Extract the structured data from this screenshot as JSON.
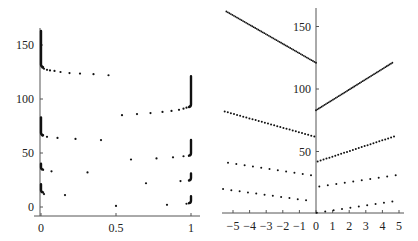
{
  "chart_data": [
    {
      "type": "scatter",
      "title": "",
      "xlabel": "",
      "ylabel": "",
      "xlim": [
        0,
        1
      ],
      "ylim": [
        0,
        165
      ],
      "grid": false,
      "x_ticks": [
        "0",
        "0.5",
        "1"
      ],
      "x_tick_values": [
        0,
        0.5,
        1
      ],
      "y_ticks": [
        "0",
        "50",
        "100",
        "150"
      ],
      "y_tick_values": [
        0,
        50,
        100,
        150
      ],
      "series": [
        {
          "name": "branch-1",
          "vertical_segments": [
            {
              "x": 0,
              "y0": 130,
              "y1": 163
            },
            {
              "x": 1,
              "y0": 93,
              "y1": 121
            }
          ],
          "points": [
            [
              0.01,
              129
            ],
            [
              0.02,
              128
            ],
            [
              0.04,
              127
            ],
            [
              0.06,
              126.5
            ],
            [
              0.09,
              126
            ],
            [
              0.13,
              125
            ],
            [
              0.19,
              124
            ],
            [
              0.26,
              123.5
            ],
            [
              0.35,
              123
            ],
            [
              0.45,
              122
            ],
            [
              0.54,
              85
            ],
            [
              0.64,
              86
            ],
            [
              0.73,
              87
            ],
            [
              0.81,
              88
            ],
            [
              0.87,
              89
            ],
            [
              0.92,
              90
            ],
            [
              0.95,
              91
            ],
            [
              0.97,
              92
            ],
            [
              0.99,
              93
            ]
          ]
        },
        {
          "name": "branch-2",
          "vertical_segments": [
            {
              "x": 0,
              "y0": 67,
              "y1": 83
            },
            {
              "x": 1,
              "y0": 48,
              "y1": 62
            }
          ],
          "points": [
            [
              0.01,
              66
            ],
            [
              0.04,
              65
            ],
            [
              0.11,
              64
            ],
            [
              0.23,
              63
            ],
            [
              0.4,
              62
            ],
            [
              0.6,
              44
            ],
            [
              0.77,
              45
            ],
            [
              0.88,
              46
            ],
            [
              0.95,
              47
            ]
          ]
        },
        {
          "name": "branch-3",
          "vertical_segments": [
            {
              "x": 0,
              "y0": 35,
              "y1": 40
            },
            {
              "x": 1,
              "y0": 25,
              "y1": 31
            }
          ],
          "points": [
            [
              0.07,
              33
            ],
            [
              0.31,
              32
            ],
            [
              0.7,
              22
            ],
            [
              0.93,
              24
            ]
          ]
        },
        {
          "name": "branch-4",
          "vertical_segments": [
            {
              "x": 0,
              "y0": 14,
              "y1": 21
            },
            {
              "x": 1,
              "y0": 4,
              "y1": 10
            }
          ],
          "points": [
            [
              0.02,
              12
            ],
            [
              0.16,
              11
            ],
            [
              0.5,
              1
            ],
            [
              0.84,
              2
            ],
            [
              0.97,
              3
            ]
          ]
        }
      ]
    },
    {
      "type": "scatter",
      "title": "",
      "xlabel": "",
      "ylabel": "",
      "xlim": [
        -5.5,
        5
      ],
      "ylim": [
        0,
        165
      ],
      "grid": false,
      "x_ticks": [
        "-5",
        "-4",
        "-3",
        "-2",
        "-1",
        "0",
        "1",
        "2",
        "3",
        "4",
        "5"
      ],
      "x_tick_values": [
        -5,
        -4,
        -3,
        -2,
        -1,
        0,
        1,
        2,
        3,
        4,
        5
      ],
      "y_ticks": [
        "50",
        "100",
        "150"
      ],
      "y_tick_values": [
        50,
        100,
        150
      ],
      "series": [
        {
          "name": "line-1-left",
          "x0": -5.4,
          "y0": 162,
          "x1": 0.0,
          "y1": 121,
          "n": 60
        },
        {
          "name": "line-1-right",
          "x0": 0.0,
          "y0": 83,
          "x1": 4.6,
          "y1": 121,
          "n": 55
        },
        {
          "name": "line-2-left",
          "x0": -5.5,
          "y0": 82,
          "x1": -0.1,
          "y1": 62,
          "n": 30
        },
        {
          "name": "line-2-right",
          "x0": 0.1,
          "y0": 42,
          "x1": 4.7,
          "y1": 62,
          "n": 27
        },
        {
          "name": "line-3-left",
          "x0": -5.3,
          "y0": 41,
          "x1": -0.3,
          "y1": 31,
          "n": 11
        },
        {
          "name": "line-3-right",
          "x0": 0.2,
          "y0": 22,
          "x1": 4.8,
          "y1": 31,
          "n": 10
        },
        {
          "name": "line-4-left",
          "x0": -5.6,
          "y0": 20,
          "x1": -0.6,
          "y1": 11,
          "n": 11
        },
        {
          "name": "line-4-right",
          "x0": 0.05,
          "y0": 1,
          "x1": 4.6,
          "y1": 10,
          "n": 10
        }
      ]
    }
  ]
}
